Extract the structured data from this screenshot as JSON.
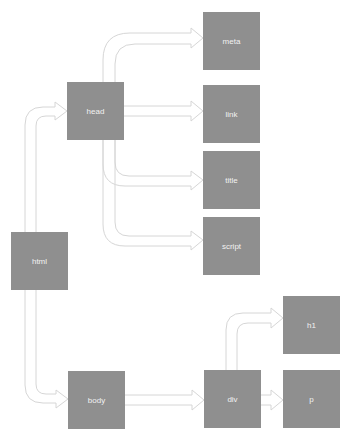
{
  "diagram": {
    "type": "tree",
    "colors": {
      "node_fill": "#8f8f8f",
      "node_text": "#f2f2f2",
      "arrow_stroke": "#d9d9d9"
    },
    "nodes": {
      "html": "html",
      "head": "head",
      "body": "body",
      "meta": "meta",
      "link": "link",
      "title": "title",
      "script": "script",
      "div": "div",
      "h1": "h1",
      "p": "p"
    },
    "edges": [
      [
        "html",
        "head"
      ],
      [
        "html",
        "body"
      ],
      [
        "head",
        "meta"
      ],
      [
        "head",
        "link"
      ],
      [
        "head",
        "title"
      ],
      [
        "head",
        "script"
      ],
      [
        "body",
        "div"
      ],
      [
        "div",
        "h1"
      ],
      [
        "div",
        "p"
      ]
    ]
  }
}
